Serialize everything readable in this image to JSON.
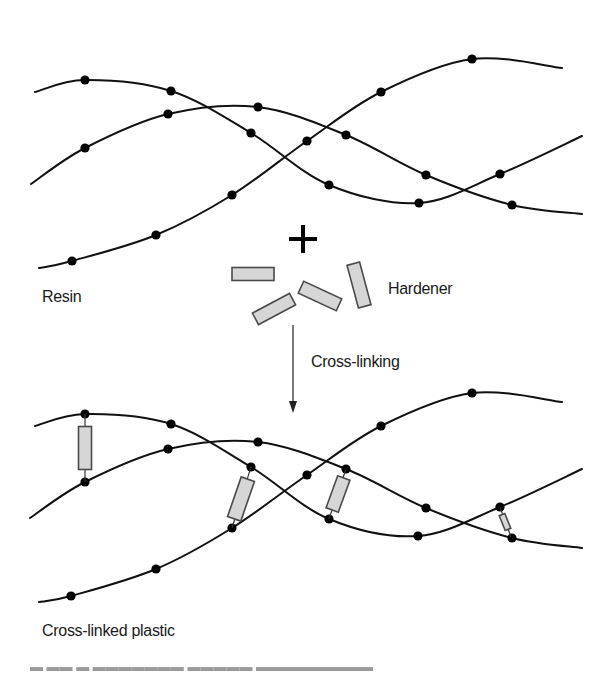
{
  "figure": {
    "colors": {
      "line": "#111111",
      "dot": "#000000",
      "rect_fill": "#d6d6d6",
      "rect_stroke": "#4a4a4a",
      "text": "#1a1a1a"
    },
    "labels": {
      "resin": "Resin",
      "hardener": "Hardener",
      "cross_linking": "Cross-linking",
      "cross_linked_plastic": "Cross-linked plastic"
    },
    "resin_chains": [
      {
        "name": "chain-a",
        "points": [
          [
            35,
            92
          ],
          [
            85,
            80
          ],
          [
            171,
            91
          ],
          [
            251,
            133
          ],
          [
            329,
            185
          ],
          [
            419,
            203
          ],
          [
            500,
            174
          ],
          [
            582,
            136
          ]
        ],
        "dots": [
          1,
          2,
          3,
          4,
          5,
          6
        ]
      },
      {
        "name": "chain-b",
        "points": [
          [
            31,
            184
          ],
          [
            85,
            148
          ],
          [
            168,
            114
          ],
          [
            258,
            107
          ],
          [
            346,
            135
          ],
          [
            426,
            175
          ],
          [
            512,
            205
          ],
          [
            582,
            214
          ]
        ],
        "dots": [
          1,
          2,
          3,
          4,
          5,
          6
        ]
      },
      {
        "name": "chain-c",
        "points": [
          [
            39,
            268
          ],
          [
            72,
            261
          ],
          [
            156,
            235
          ],
          [
            232,
            195
          ],
          [
            307,
            141
          ],
          [
            381,
            92
          ],
          [
            472,
            59
          ],
          [
            562,
            68
          ]
        ],
        "dots": [
          1,
          2,
          3,
          4,
          5,
          6
        ]
      }
    ],
    "plus_sign": {
      "cx": 303,
      "cy": 239,
      "arm": 14,
      "thickness": 4
    },
    "hardener_molecules": [
      {
        "cx": 253,
        "cy": 274,
        "w": 42,
        "h": 13,
        "angle": 0
      },
      {
        "cx": 320,
        "cy": 296,
        "w": 42,
        "h": 13,
        "angle": 25
      },
      {
        "cx": 359,
        "cy": 285,
        "w": 13,
        "h": 44,
        "angle": -15
      },
      {
        "cx": 274,
        "cy": 309,
        "w": 42,
        "h": 13,
        "angle": -28
      }
    ],
    "arrow": {
      "x": 293,
      "y1": 325,
      "y2": 413
    },
    "plastic_chains": [
      {
        "name": "chain-a",
        "points": [
          [
            35,
            426
          ],
          [
            85,
            414
          ],
          [
            171,
            424
          ],
          [
            251,
            467
          ],
          [
            329,
            519
          ],
          [
            418,
            536
          ],
          [
            500,
            507
          ],
          [
            582,
            469
          ]
        ],
        "dots": [
          1,
          2,
          3,
          4,
          5,
          6
        ]
      },
      {
        "name": "chain-b",
        "points": [
          [
            30,
            518
          ],
          [
            85,
            482
          ],
          [
            168,
            449
          ],
          [
            258,
            442
          ],
          [
            346,
            469
          ],
          [
            426,
            508
          ],
          [
            512,
            538
          ],
          [
            582,
            548
          ]
        ],
        "dots": [
          1,
          2,
          3,
          4,
          5,
          6
        ]
      },
      {
        "name": "chain-c",
        "points": [
          [
            39,
            602
          ],
          [
            71,
            596
          ],
          [
            156,
            569
          ],
          [
            232,
            528
          ],
          [
            307,
            475
          ],
          [
            381,
            426
          ],
          [
            472,
            393
          ],
          [
            562,
            402
          ]
        ],
        "dots": [
          1,
          2,
          3,
          4,
          5,
          6
        ]
      }
    ],
    "cross_links": [
      {
        "from": [
          85,
          414
        ],
        "to": [
          85,
          482
        ],
        "cx": 85,
        "cy": 448,
        "w": 13,
        "h": 43,
        "angle": 0
      },
      {
        "from": [
          251,
          467
        ],
        "to": [
          232,
          528
        ],
        "cx": 241,
        "cy": 499,
        "w": 14,
        "h": 42,
        "angle": 19
      },
      {
        "from": [
          346,
          469
        ],
        "to": [
          329,
          519
        ],
        "cx": 338,
        "cy": 494,
        "w": 13,
        "h": 34,
        "angle": 20
      },
      {
        "from": [
          500,
          507
        ],
        "to": [
          511,
          537
        ],
        "cx": 505,
        "cy": 522,
        "w": 6,
        "h": 16,
        "angle": -22
      }
    ],
    "text_positions": {
      "resin": [
        42,
        302
      ],
      "hardener": [
        388,
        294
      ],
      "cross_linking": [
        311,
        367
      ],
      "cross_linked_plastic": [
        42,
        636
      ]
    }
  }
}
